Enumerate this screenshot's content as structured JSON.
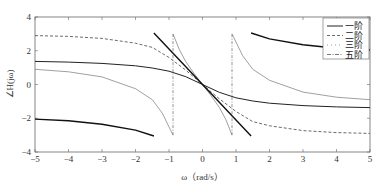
{
  "chart_data": {
    "type": "line",
    "title": "",
    "xlabel": "ω（rad/s）",
    "ylabel": "∠H(jω)",
    "xlim": [
      -5,
      5
    ],
    "ylim": [
      -4,
      4
    ],
    "xticks": [
      -5,
      -4,
      -3,
      -2,
      -1,
      0,
      1,
      2,
      3,
      4,
      5
    ],
    "yticks": [
      -4,
      -2,
      0,
      2,
      4
    ],
    "grid": false,
    "legend_position": "upper right",
    "series": [
      {
        "name": "一阶",
        "style": "solid",
        "segments": [
          [
            [
              -5,
              1.37
            ],
            [
              -4,
              1.33
            ],
            [
              -3,
              1.25
            ],
            [
              -2,
              1.11
            ],
            [
              -1.5,
              0.98
            ],
            [
              -1,
              0.79
            ],
            [
              -0.5,
              0.46
            ],
            [
              0,
              0
            ],
            [
              0.5,
              -0.46
            ],
            [
              1,
              -0.79
            ],
            [
              1.5,
              -0.98
            ],
            [
              2,
              -1.11
            ],
            [
              3,
              -1.25
            ],
            [
              4,
              -1.33
            ],
            [
              5,
              -1.37
            ]
          ]
        ]
      },
      {
        "name": "二阶",
        "style": "dashed",
        "segments": [
          [
            [
              -5,
              2.9
            ],
            [
              -4,
              2.85
            ],
            [
              -3,
              2.73
            ],
            [
              -2,
              2.45
            ],
            [
              -1.5,
              2.2
            ],
            [
              -1,
              1.6
            ],
            [
              -0.5,
              0.85
            ],
            [
              0,
              0
            ],
            [
              0.5,
              -0.85
            ],
            [
              1,
              -1.6
            ],
            [
              1.5,
              -2.2
            ],
            [
              2,
              -2.45
            ],
            [
              3,
              -2.73
            ],
            [
              4,
              -2.85
            ],
            [
              5,
              -2.9
            ]
          ]
        ]
      },
      {
        "name": "三阶",
        "style": "thin-solid",
        "segments": [
          [
            [
              -5,
              0.9
            ],
            [
              -4,
              0.75
            ],
            [
              -3,
              0.45
            ],
            [
              -2,
              -0.25
            ],
            [
              -1.5,
              -0.9
            ],
            [
              -1.2,
              -1.7
            ],
            [
              -0.88,
              -3.0
            ]
          ],
          [
            [
              -0.88,
              3.0
            ],
            [
              -0.7,
              2.1
            ],
            [
              -0.5,
              1.35
            ],
            [
              -0.25,
              0.65
            ],
            [
              0,
              0
            ],
            [
              0.25,
              -0.65
            ],
            [
              0.5,
              -1.35
            ],
            [
              0.7,
              -2.1
            ],
            [
              0.88,
              -3.0
            ]
          ],
          [
            [
              0.88,
              3.0
            ],
            [
              1.2,
              1.7
            ],
            [
              1.5,
              0.9
            ],
            [
              2,
              0.25
            ],
            [
              3,
              -0.45
            ],
            [
              4,
              -0.75
            ],
            [
              5,
              -0.9
            ]
          ]
        ]
      },
      {
        "name": "五阶",
        "style": "thick-solid",
        "segments": [
          [
            [
              -5,
              -2.05
            ],
            [
              -4,
              -2.15
            ],
            [
              -3,
              -2.35
            ],
            [
              -2,
              -2.7
            ],
            [
              -1.45,
              -3.05
            ]
          ],
          [
            [
              -1.45,
              3.05
            ],
            [
              -1,
              2.1
            ],
            [
              -0.5,
              1.05
            ],
            [
              0,
              0
            ],
            [
              0.5,
              -1.05
            ],
            [
              1,
              -2.1
            ],
            [
              1.45,
              -3.05
            ]
          ],
          [
            [
              1.45,
              3.05
            ],
            [
              2,
              2.7
            ],
            [
              3,
              2.35
            ],
            [
              4,
              2.15
            ],
            [
              5,
              2.05
            ]
          ]
        ]
      },
      {
        "name": "三阶-jumps",
        "style": "dash-dot-vertical",
        "segments": [
          [
            [
              -0.88,
              -3.0
            ],
            [
              -0.88,
              3.0
            ]
          ],
          [
            [
              0.88,
              -3.0
            ],
            [
              0.88,
              3.0
            ]
          ]
        ]
      }
    ],
    "legend": [
      "一阶",
      "二阶",
      "三阶",
      "五阶"
    ]
  },
  "labels": {
    "xlabel": "ω（rad/s）",
    "ylabel": "∠H(jω)",
    "legend": [
      "一阶",
      "二阶",
      "三阶",
      "五阶"
    ]
  }
}
